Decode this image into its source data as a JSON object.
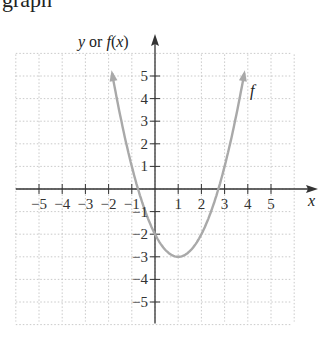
{
  "top_fragment": "graph",
  "chart_data": {
    "type": "line",
    "title": "",
    "function": "f(x) = (x - 1)^2 - 3",
    "xlabel": "x",
    "ylabel": "y or f(x)",
    "curve_label": "f",
    "xlim": [
      -6,
      6
    ],
    "ylim": [
      -6,
      6
    ],
    "grid": true,
    "x_ticks": [
      -5,
      -4,
      -3,
      -2,
      -1,
      1,
      2,
      3,
      4,
      5
    ],
    "y_ticks": [
      -5,
      -4,
      -3,
      -2,
      -1,
      1,
      2,
      3,
      4,
      5
    ],
    "x_tick_labels": [
      "−5",
      "−4",
      "−3",
      "−2",
      "−1",
      "1",
      "2",
      "3",
      "4",
      "5"
    ],
    "y_tick_labels": [
      "−5",
      "−4",
      "−3",
      "−2",
      "−1",
      "1",
      "2",
      "3",
      "4",
      "5"
    ],
    "points": [
      {
        "x": -1.9,
        "y": 5.41
      },
      {
        "x": -1.5,
        "y": 3.25
      },
      {
        "x": -1,
        "y": 1
      },
      {
        "x": -0.73,
        "y": 0
      },
      {
        "x": 0,
        "y": -2
      },
      {
        "x": 0.5,
        "y": -2.75
      },
      {
        "x": 1,
        "y": -3
      },
      {
        "x": 1.5,
        "y": -2.75
      },
      {
        "x": 2,
        "y": -2
      },
      {
        "x": 2.73,
        "y": 0
      },
      {
        "x": 3,
        "y": 1
      },
      {
        "x": 3.5,
        "y": 3.25
      },
      {
        "x": 3.9,
        "y": 5.41
      }
    ],
    "vertex": {
      "x": 1,
      "y": -3
    },
    "y_intercept": -2,
    "x_intercepts": [
      -0.73,
      2.73
    ],
    "both_ends_arrows": true
  },
  "colors": {
    "axis": "#333333",
    "grid": "#bbbbbb",
    "curve": "#a9a9a9",
    "text": "#222222"
  }
}
